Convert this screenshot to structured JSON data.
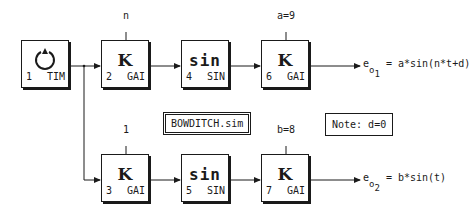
{
  "diagram": {
    "title": "BOWDITCH.sim",
    "note": "Note: d=0",
    "blocks": [
      {
        "id": "1",
        "type": "TIM",
        "symbol": "clock-icon"
      },
      {
        "id": "2",
        "type": "GAI",
        "symbol": "K",
        "param": "n"
      },
      {
        "id": "4",
        "type": "SIN",
        "symbol": "sin"
      },
      {
        "id": "6",
        "type": "GAI",
        "symbol": "K",
        "param": "a=9"
      },
      {
        "id": "3",
        "type": "GAI",
        "symbol": "K",
        "param": "1"
      },
      {
        "id": "5",
        "type": "SIN",
        "symbol": "sin"
      },
      {
        "id": "7",
        "type": "GAI",
        "symbol": "K",
        "param": "b=8"
      }
    ],
    "outputs": [
      {
        "e": "e",
        "o": "o",
        "sub": "1",
        "expr": "= a*sin(n*t+d)"
      },
      {
        "e": "e",
        "o": "o",
        "sub": "2",
        "expr": "= b*sin(t)"
      }
    ],
    "connections": [
      {
        "from": "1",
        "to": "2"
      },
      {
        "from": "1",
        "to": "3"
      },
      {
        "from": "2",
        "to": "4"
      },
      {
        "from": "4",
        "to": "6"
      },
      {
        "from": "3",
        "to": "5"
      },
      {
        "from": "5",
        "to": "7"
      },
      {
        "from": "6",
        "to": "output-1"
      },
      {
        "from": "7",
        "to": "output-2"
      }
    ]
  }
}
